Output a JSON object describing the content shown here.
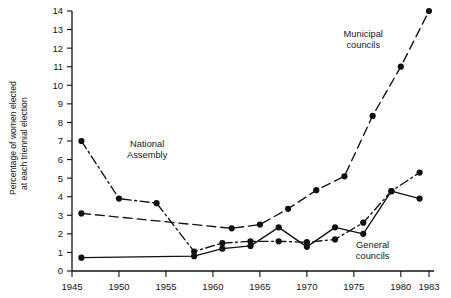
{
  "chart_data": {
    "type": "line",
    "title": "",
    "xlabel": "",
    "ylabel": "Percentage of women elected at each triennial election",
    "xlim": [
      1945,
      1983
    ],
    "ylim": [
      0,
      14
    ],
    "grid": false,
    "legend_position": "inline-annotations",
    "xticks": [
      1945,
      1950,
      1955,
      1960,
      1965,
      1970,
      1975,
      1980,
      1983
    ],
    "yticks": [
      0,
      1,
      2,
      3,
      4,
      5,
      6,
      7,
      8,
      9,
      10,
      11,
      12,
      13,
      14
    ],
    "xtick_labels": [
      "1945",
      "1950",
      "1955",
      "1960",
      "1965",
      "1970",
      "1975",
      "1980",
      "1983"
    ],
    "ytick_labels": [
      "0",
      "1",
      "2",
      "3",
      "4",
      "5",
      "6",
      "7",
      "8",
      "9",
      "10",
      "11",
      "12",
      "13",
      "14"
    ],
    "series": [
      {
        "name": "National Assembly",
        "style": "dash-dot",
        "color": "#111111",
        "marker": "filled-circle",
        "points": [
          {
            "x": 1946,
            "y": 7.0
          },
          {
            "x": 1950,
            "y": 3.9
          },
          {
            "x": 1954,
            "y": 3.65
          },
          {
            "x": 1958,
            "y": 1.05
          },
          {
            "x": 1961,
            "y": 1.5
          },
          {
            "x": 1964,
            "y": 1.6
          },
          {
            "x": 1967,
            "y": 1.6
          },
          {
            "x": 1970,
            "y": 1.55
          },
          {
            "x": 1973,
            "y": 1.7
          },
          {
            "x": 1976,
            "y": 2.6
          },
          {
            "x": 1979,
            "y": 4.3
          },
          {
            "x": 1982,
            "y": 5.3
          }
        ]
      },
      {
        "name": "Municipal councils",
        "style": "dashed",
        "color": "#111111",
        "marker": "filled-circle",
        "points": [
          {
            "x": 1946,
            "y": 3.1
          },
          {
            "x": 1962,
            "y": 2.3
          },
          {
            "x": 1965,
            "y": 2.5
          },
          {
            "x": 1968,
            "y": 3.35
          },
          {
            "x": 1971,
            "y": 4.35
          },
          {
            "x": 1974,
            "y": 5.1
          },
          {
            "x": 1977,
            "y": 8.35
          },
          {
            "x": 1980,
            "y": 11.0
          },
          {
            "x": 1983,
            "y": 14.0
          }
        ]
      },
      {
        "name": "General councils",
        "style": "solid",
        "color": "#111111",
        "marker": "filled-circle",
        "points": [
          {
            "x": 1946,
            "y": 0.72
          },
          {
            "x": 1958,
            "y": 0.8
          },
          {
            "x": 1961,
            "y": 1.2
          },
          {
            "x": 1964,
            "y": 1.35
          },
          {
            "x": 1967,
            "y": 2.35
          },
          {
            "x": 1970,
            "y": 1.3
          },
          {
            "x": 1973,
            "y": 2.35
          },
          {
            "x": 1976,
            "y": 2.0
          },
          {
            "x": 1979,
            "y": 4.3
          },
          {
            "x": 1982,
            "y": 3.9
          }
        ]
      }
    ],
    "annotations": [
      {
        "text": "National\nAssembly",
        "line1": "National",
        "line2": "Assembly",
        "x": 1953,
        "y": 6.7
      },
      {
        "text": "Municipal\ncouncils",
        "line1": "Municipal",
        "line2": "councils",
        "x": 1976,
        "y": 12.6
      },
      {
        "text": "General\ncouncils",
        "line1": "General",
        "line2": "councils",
        "x": 1977,
        "y": 1.25
      }
    ]
  },
  "axis": {
    "y_title_line1": "Percentage of women elected",
    "y_title_line2": "at each triennial election"
  }
}
